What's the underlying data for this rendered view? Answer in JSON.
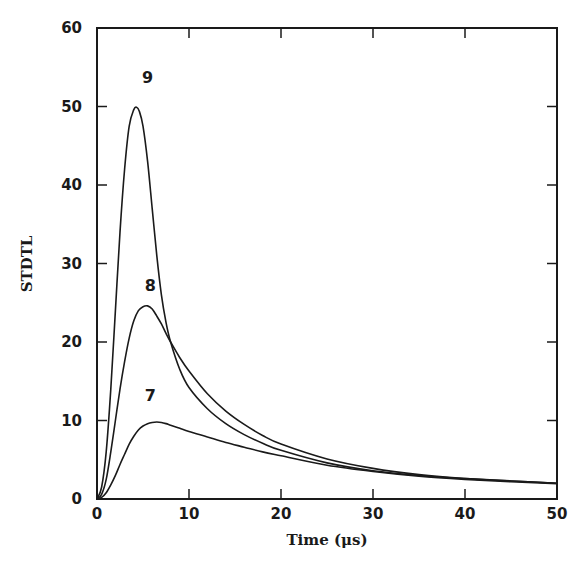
{
  "chart_data": {
    "type": "line",
    "title": "",
    "xlabel": "Time (μs)",
    "ylabel": "STDTL",
    "xlim": [
      0,
      50
    ],
    "ylim": [
      0,
      60
    ],
    "xticks": [
      0,
      10,
      20,
      30,
      40,
      50
    ],
    "yticks": [
      0,
      10,
      20,
      30,
      40,
      50,
      60
    ],
    "grid": false,
    "legend": "none (curves labeled inline)",
    "series": [
      {
        "name": "9",
        "label_position": {
          "x": 5.5,
          "y": 53
        },
        "x": [
          0,
          0.5,
          1,
          1.5,
          2,
          2.5,
          3,
          3.5,
          4,
          4.3,
          4.6,
          5,
          5.5,
          6,
          6.5,
          7,
          7.5,
          8,
          9,
          10,
          12,
          14,
          16,
          18,
          20,
          25,
          30,
          35,
          40,
          45,
          50
        ],
        "values": [
          0,
          1.5,
          6,
          14,
          24,
          34,
          42,
          47.5,
          49.6,
          49.9,
          49.4,
          47.5,
          43,
          37,
          31,
          26,
          22.5,
          20,
          16.5,
          14.2,
          11.5,
          9.6,
          8.2,
          7.1,
          6.2,
          4.6,
          3.6,
          3.0,
          2.6,
          2.3,
          2.0
        ]
      },
      {
        "name": "8",
        "label_position": {
          "x": 5.8,
          "y": 26.5
        },
        "x": [
          0,
          0.5,
          1,
          1.5,
          2,
          2.5,
          3,
          3.5,
          4,
          4.5,
          5,
          5.5,
          6,
          6.5,
          7,
          7.5,
          8,
          9,
          10,
          12,
          14,
          16,
          18,
          20,
          25,
          30,
          35,
          40,
          45,
          50
        ],
        "values": [
          0,
          0.6,
          2.5,
          6,
          10,
          14,
          17.5,
          20.5,
          22.7,
          24,
          24.5,
          24.6,
          24.2,
          23.3,
          22.3,
          21.1,
          20,
          18,
          16.3,
          13.4,
          11.2,
          9.5,
          8.1,
          7.0,
          5.1,
          3.9,
          3.1,
          2.6,
          2.3,
          2.0
        ]
      },
      {
        "name": "7",
        "label_position": {
          "x": 5.8,
          "y": 12.5
        },
        "x": [
          0,
          0.5,
          1,
          1.5,
          2,
          2.5,
          3,
          3.5,
          4,
          4.5,
          5,
          5.5,
          6,
          6.5,
          7,
          7.5,
          8,
          9,
          10,
          12,
          14,
          16,
          18,
          20,
          25,
          30,
          35,
          40,
          45,
          50
        ],
        "values": [
          0,
          0.2,
          0.8,
          1.8,
          3,
          4.4,
          5.7,
          7,
          8,
          8.8,
          9.3,
          9.6,
          9.75,
          9.8,
          9.75,
          9.6,
          9.4,
          9.0,
          8.6,
          7.9,
          7.2,
          6.6,
          6.0,
          5.5,
          4.3,
          3.5,
          2.9,
          2.5,
          2.2,
          1.95
        ]
      }
    ]
  },
  "axes": {
    "x_label": "Time (μs)",
    "y_label": "STDTL",
    "x_tick_labels": [
      "0",
      "10",
      "20",
      "30",
      "40",
      "50"
    ],
    "y_tick_labels": [
      "0",
      "10",
      "20",
      "30",
      "40",
      "50",
      "60"
    ]
  },
  "colors": {
    "line": "#1a1a1a",
    "background": "#ffffff"
  }
}
